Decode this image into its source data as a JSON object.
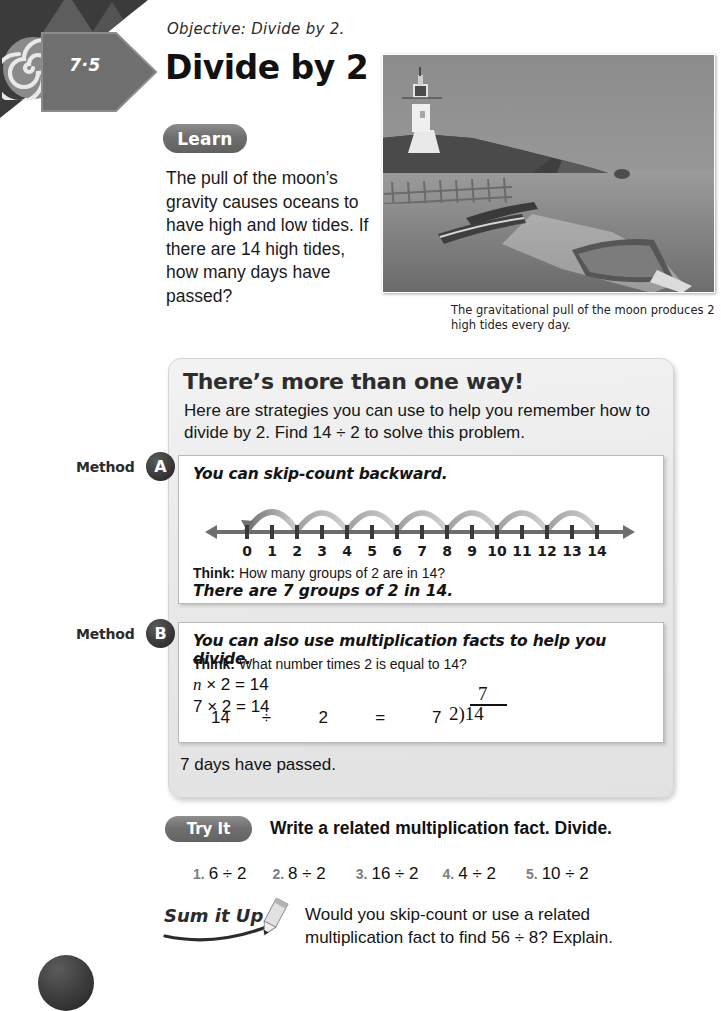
{
  "lesson": {
    "number": "7·5",
    "objective": "Objective:  Divide by 2.",
    "title": "Divide by 2"
  },
  "learn": {
    "badge": "Learn",
    "paragraph": "The pull of the moon’s gravity causes oceans to have high and low tides. If there are 14 high tides, how many days have passed?"
  },
  "photo": {
    "alt": "lighthouse-beach-photo",
    "caption": "The gravitational pull of the moon produces 2 high tides every day."
  },
  "strategy": {
    "heading": "There’s more than one way!",
    "intro": "Here are strategies you can use to help you remember how to divide by 2. Find 14 ÷ 2 to solve this problem.",
    "answer": "7 days have passed."
  },
  "method_a": {
    "label": "Method",
    "bullet": "A",
    "lead": "You can skip-count backward.",
    "think_label": "Think:",
    "think_question": "How many groups of 2 are in 14?",
    "result": "There are 7 groups of 2 in 14."
  },
  "method_b": {
    "label": "Method",
    "bullet": "B",
    "lead": "You can also use multiplication facts to help you divide.",
    "think_label": "Think:",
    "think_question": "What number times 2 is equal to 14?",
    "equation_1_var": "n",
    "equation_1_rest": " × 2 = 14",
    "equation_2": "7 × 2 = 14",
    "sentence_dividend": "14",
    "sentence_operator": "÷",
    "sentence_divisor": "2",
    "sentence_equals": "=",
    "sentence_quotient": "7",
    "long_division_quotient": "7",
    "long_division_divisor": "2",
    "long_division_dividend": "14"
  },
  "numberline": {
    "min": 0,
    "max": 14,
    "ticks": [
      "0",
      "1",
      "2",
      "3",
      "4",
      "5",
      "6",
      "7",
      "8",
      "9",
      "10",
      "11",
      "12",
      "13",
      "14"
    ],
    "arc_jumps": [
      [
        14,
        12
      ],
      [
        12,
        10
      ],
      [
        10,
        8
      ],
      [
        8,
        6
      ],
      [
        6,
        4
      ],
      [
        4,
        2
      ],
      [
        2,
        0
      ]
    ],
    "direction": "backward"
  },
  "try_it": {
    "badge": "Try It",
    "instruction": "Write a related multiplication fact. Divide.",
    "exercises": [
      {
        "num": "1.",
        "expr": "6 ÷ 2"
      },
      {
        "num": "2.",
        "expr": "8 ÷ 2"
      },
      {
        "num": "3.",
        "expr": "16 ÷ 2"
      },
      {
        "num": "4.",
        "expr": "4 ÷ 2"
      },
      {
        "num": "5.",
        "expr": "10 ÷ 2"
      }
    ]
  },
  "sum_it_up": {
    "logo_text": "Sum it Up",
    "question": "Would you skip-count or use a related multiplication fact to find 56 ÷ 8? Explain."
  },
  "colors": {
    "panel_bg": "#eeeeee",
    "badge_gray": "#6e6e6e",
    "bullet_dark": "#2f2f2f",
    "corner_dark": "#3b3b3b",
    "arc_gray": "#9a9a9a"
  }
}
